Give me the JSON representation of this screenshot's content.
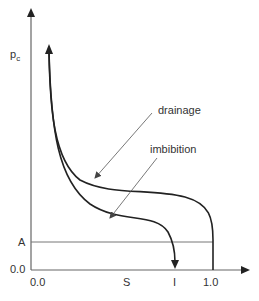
{
  "diagram": {
    "type": "capillary-pressure-hysteresis",
    "y_axis": {
      "label": "p",
      "label_sub": "c",
      "ticks": [
        "A",
        "0.0"
      ]
    },
    "x_axis": {
      "ticks": [
        "0.0",
        "S",
        "I",
        "1.0"
      ]
    },
    "curves": [
      {
        "name": "drainage",
        "label": "drainage"
      },
      {
        "name": "imbibition",
        "label": "imbibition"
      }
    ],
    "colors": {
      "axis": "#666666",
      "curve": "#222222",
      "text": "#333333"
    }
  }
}
